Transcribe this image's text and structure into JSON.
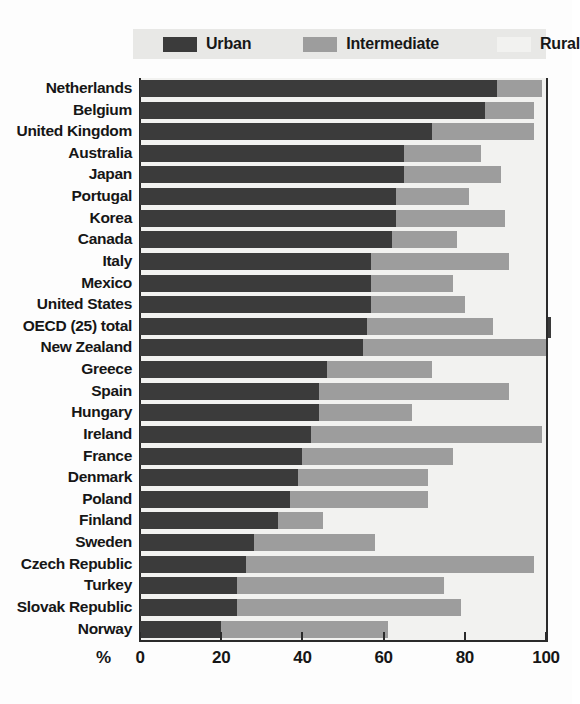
{
  "chart_data": {
    "type": "bar",
    "subtype": "horizontal-stacked-100",
    "title": "",
    "xlabel": "%",
    "ylabel": "",
    "xlim": [
      0,
      100
    ],
    "xticks": [
      0,
      20,
      40,
      60,
      80,
      100
    ],
    "grid": false,
    "legend_position": "top",
    "colors": {
      "urban": "#3b3b3b",
      "intermediate": "#9d9d9d",
      "rural": "#f2f2f0",
      "plot_background": "#f2f2f0",
      "legend_background": "#e8e8e6",
      "axis": "#2b2b2b"
    },
    "legend": [
      {
        "key": "urban",
        "label": "Urban",
        "swatch": "#3b3b3b"
      },
      {
        "key": "intermediate",
        "label": "Intermediate",
        "swatch": "#9d9d9d"
      },
      {
        "key": "rural",
        "label": "Rural",
        "swatch": "#f2f2f0"
      }
    ],
    "series": [
      {
        "name": "Urban",
        "key": "urban"
      },
      {
        "name": "Intermediate",
        "key": "intermediate"
      },
      {
        "name": "Rural",
        "key": "rural"
      }
    ],
    "categories": [
      "Netherlands",
      "Belgium",
      "United Kingdom",
      "Australia",
      "Japan",
      "Portugal",
      "Korea",
      "Canada",
      "Italy",
      "Mexico",
      "United States",
      "OECD (25) total",
      "New Zealand",
      "Greece",
      "Spain",
      "Hungary",
      "Ireland",
      "France",
      "Denmark",
      "Poland",
      "Finland",
      "Sweden",
      "Czech Republic",
      "Turkey",
      "Slovak Republic",
      "Norway"
    ],
    "rows": [
      {
        "category": "Netherlands",
        "urban": 88,
        "intermediate": 11,
        "rural": 1,
        "highlight": false
      },
      {
        "category": "Belgium",
        "urban": 85,
        "intermediate": 12,
        "rural": 3,
        "highlight": false
      },
      {
        "category": "United Kingdom",
        "urban": 72,
        "intermediate": 25,
        "rural": 3,
        "highlight": false
      },
      {
        "category": "Australia",
        "urban": 65,
        "intermediate": 19,
        "rural": 16,
        "highlight": false
      },
      {
        "category": "Japan",
        "urban": 65,
        "intermediate": 24,
        "rural": 11,
        "highlight": false
      },
      {
        "category": "Portugal",
        "urban": 63,
        "intermediate": 18,
        "rural": 19,
        "highlight": false
      },
      {
        "category": "Korea",
        "urban": 63,
        "intermediate": 27,
        "rural": 10,
        "highlight": false
      },
      {
        "category": "Canada",
        "urban": 62,
        "intermediate": 16,
        "rural": 22,
        "highlight": false
      },
      {
        "category": "Italy",
        "urban": 57,
        "intermediate": 34,
        "rural": 9,
        "highlight": false
      },
      {
        "category": "Mexico",
        "urban": 57,
        "intermediate": 20,
        "rural": 23,
        "highlight": false
      },
      {
        "category": "United States",
        "urban": 57,
        "intermediate": 23,
        "rural": 20,
        "highlight": false
      },
      {
        "category": "OECD (25) total",
        "urban": 56,
        "intermediate": 31,
        "rural": 13,
        "highlight": true
      },
      {
        "category": "New Zealand",
        "urban": 55,
        "intermediate": 45,
        "rural": 0,
        "highlight": false
      },
      {
        "category": "Greece",
        "urban": 46,
        "intermediate": 26,
        "rural": 28,
        "highlight": false
      },
      {
        "category": "Spain",
        "urban": 44,
        "intermediate": 47,
        "rural": 9,
        "highlight": false
      },
      {
        "category": "Hungary",
        "urban": 44,
        "intermediate": 23,
        "rural": 33,
        "highlight": false
      },
      {
        "category": "Ireland",
        "urban": 42,
        "intermediate": 57,
        "rural": 1,
        "highlight": false
      },
      {
        "category": "France",
        "urban": 40,
        "intermediate": 37,
        "rural": 23,
        "highlight": false
      },
      {
        "category": "Denmark",
        "urban": 39,
        "intermediate": 32,
        "rural": 29,
        "highlight": false
      },
      {
        "category": "Poland",
        "urban": 37,
        "intermediate": 34,
        "rural": 29,
        "highlight": false
      },
      {
        "category": "Finland",
        "urban": 34,
        "intermediate": 11,
        "rural": 55,
        "highlight": false
      },
      {
        "category": "Sweden",
        "urban": 28,
        "intermediate": 30,
        "rural": 42,
        "highlight": false
      },
      {
        "category": "Czech Republic",
        "urban": 26,
        "intermediate": 71,
        "rural": 3,
        "highlight": false
      },
      {
        "category": "Turkey",
        "urban": 24,
        "intermediate": 51,
        "rural": 25,
        "highlight": false
      },
      {
        "category": "Slovak Republic",
        "urban": 24,
        "intermediate": 55,
        "rural": 21,
        "highlight": false
      },
      {
        "category": "Norway",
        "urban": 20,
        "intermediate": 41,
        "rural": 39,
        "highlight": false
      }
    ]
  },
  "legend": {
    "urban_label": "Urban",
    "intermediate_label": "Intermediate",
    "rural_label": "Rural"
  },
  "axis": {
    "unit": "%",
    "ticks": [
      "0",
      "20",
      "40",
      "60",
      "80",
      "100"
    ]
  }
}
